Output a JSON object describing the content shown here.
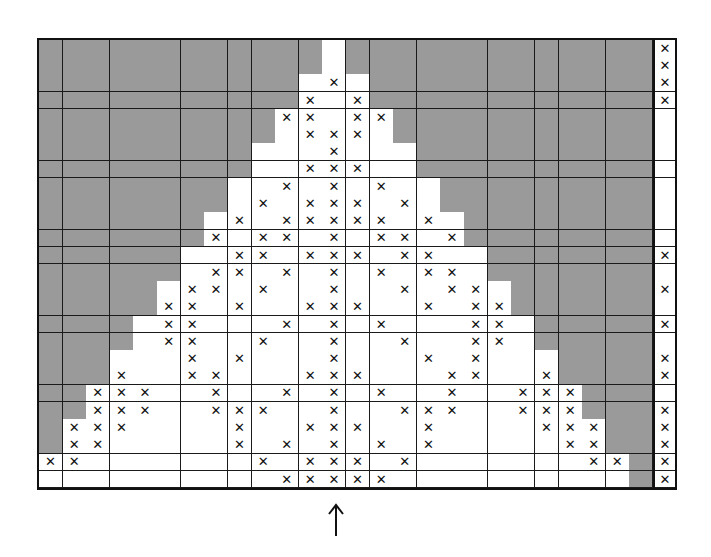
{
  "figure": {
    "cols": 26,
    "rows": 26,
    "colors": {
      "background_cells": "#9a9a9a",
      "motif_cells": "#ffffff",
      "grid_lines": "#1a1a1a",
      "mark": "#111111"
    },
    "mark_symbol": "✕",
    "center_column": 12,
    "arrow_symbol": "↑"
  },
  "grid": {
    "white_ranges": [
      [
        12,
        12
      ],
      [
        12,
        12
      ],
      [
        11,
        13
      ],
      [
        11,
        13
      ],
      [
        10,
        14
      ],
      [
        10,
        14
      ],
      [
        9,
        15
      ],
      [
        9,
        15
      ],
      [
        8,
        16
      ],
      [
        8,
        16
      ],
      [
        7,
        17
      ],
      [
        7,
        17
      ],
      [
        6,
        18
      ],
      [
        6,
        18
      ],
      [
        5,
        19
      ],
      [
        5,
        19
      ],
      [
        4,
        20
      ],
      [
        4,
        20
      ],
      [
        3,
        21
      ],
      [
        3,
        21
      ],
      [
        2,
        22
      ],
      [
        2,
        22
      ],
      [
        1,
        23
      ],
      [
        1,
        23
      ],
      [
        0,
        24
      ],
      [
        0,
        24
      ]
    ],
    "marks": [
      [],
      [],
      [
        12
      ],
      [
        11,
        13
      ],
      [
        10,
        11,
        13,
        14
      ],
      [
        11,
        12,
        13
      ],
      [
        12
      ],
      [
        11,
        12,
        13
      ],
      [
        10,
        12,
        14
      ],
      [
        9,
        11,
        12,
        13,
        15
      ],
      [
        8,
        10,
        11,
        12,
        13,
        14,
        16
      ],
      [
        7,
        9,
        10,
        12,
        14,
        15,
        17
      ],
      [
        8,
        9,
        11,
        12,
        13,
        15,
        16
      ],
      [
        7,
        8,
        10,
        12,
        14,
        16,
        17
      ],
      [
        6,
        7,
        9,
        12,
        15,
        17,
        18
      ],
      [
        5,
        6,
        8,
        11,
        12,
        13,
        16,
        18,
        19
      ],
      [
        5,
        6,
        10,
        12,
        14,
        18,
        19
      ],
      [
        5,
        6,
        9,
        12,
        15,
        18,
        19
      ],
      [
        6,
        8,
        12,
        16,
        18
      ],
      [
        3,
        6,
        7,
        11,
        12,
        13,
        17,
        18,
        21
      ],
      [
        2,
        3,
        4,
        7,
        10,
        12,
        14,
        17,
        20,
        21,
        22
      ],
      [
        2,
        3,
        4,
        7,
        8,
        9,
        12,
        15,
        16,
        17,
        20,
        21,
        22
      ],
      [
        1,
        2,
        3,
        8,
        11,
        12,
        13,
        16,
        21,
        22,
        23
      ],
      [
        1,
        2,
        8,
        10,
        12,
        14,
        16,
        22,
        23
      ],
      [
        0,
        1,
        9,
        11,
        12,
        13,
        15,
        23,
        24
      ],
      [
        10,
        11,
        12,
        13,
        14
      ]
    ]
  },
  "side_column": {
    "rows": 26,
    "marked_rows": [
      0,
      1,
      2,
      3,
      12,
      14,
      16,
      18,
      19,
      21,
      22,
      23,
      24,
      25
    ]
  }
}
